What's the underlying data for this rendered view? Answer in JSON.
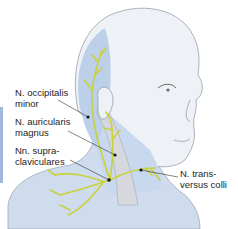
{
  "figure": {
    "colors": {
      "skin": "#eef2f6",
      "skin_outline": "#8a94a0",
      "innervated_area": "#bcd0ea",
      "nerve": "#c8d23a",
      "muscle": "#d5d8dc",
      "leader_line": "#333333",
      "side_bar": "#9fb8dc"
    },
    "labels": [
      {
        "id": "occipitalis",
        "line1": "N. occipitalis",
        "line2": "minor"
      },
      {
        "id": "auricularis",
        "line1": "N. auricularis",
        "line2": "magnus"
      },
      {
        "id": "supraclaviculares",
        "line1": "Nn. supra-",
        "line2": "claviculares"
      },
      {
        "id": "transversus",
        "line1": "N. trans-",
        "line2": "versus colli"
      }
    ]
  }
}
